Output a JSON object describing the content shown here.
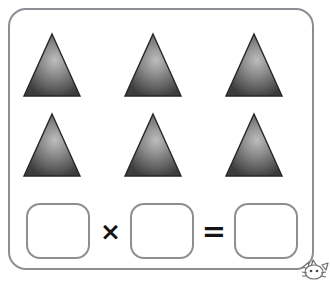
{
  "worksheet": {
    "title": "Multiplication array worksheet",
    "frame_border_color": "#8b8f94",
    "background_color": "#ffffff"
  },
  "shape_grid": {
    "description": "Array of identical triangles arranged in 2 rows of 3",
    "shape_name": "triangle",
    "rows": 2,
    "columns": 3,
    "total_count": 6,
    "shape_fill_light": "#b4b4b4",
    "shape_fill_dark": "#3f3f3f",
    "shape_outline_color": "#2b2b2b",
    "items": [
      {
        "row": 1,
        "column": 1,
        "icon": "triangle-icon"
      },
      {
        "row": 1,
        "column": 2,
        "icon": "triangle-icon"
      },
      {
        "row": 1,
        "column": 3,
        "icon": "triangle-icon"
      },
      {
        "row": 2,
        "column": 1,
        "icon": "triangle-icon"
      },
      {
        "row": 2,
        "column": 2,
        "icon": "triangle-icon"
      },
      {
        "row": 2,
        "column": 3,
        "icon": "triangle-icon"
      }
    ]
  },
  "equation": {
    "description": "Blank multiplication sentence to be completed",
    "multiplicand": {
      "value": "",
      "placeholder": ""
    },
    "multiplier": {
      "value": "",
      "placeholder": ""
    },
    "product": {
      "value": "",
      "placeholder": ""
    },
    "times_symbol": "×",
    "equals_symbol": "=",
    "box_border_color": "#8b8f94"
  },
  "mascot": {
    "icon": "cartoon-animal-face-icon",
    "description": "Partially visible grayscale cartoon animal peeking in from the bottom-right corner",
    "line_color": "#6e6e6e"
  }
}
